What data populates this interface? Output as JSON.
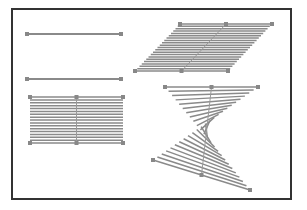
{
  "figure": {
    "frame": {
      "x": 12,
      "y": 9,
      "w": 279,
      "h": 190,
      "stroke": "#333333"
    },
    "line_color": "#8a8a8a",
    "handle_color": "#888888",
    "shapes": [
      {
        "name": "single-line-top",
        "type": "line",
        "x1": 27,
        "y1": 34,
        "x2": 121,
        "y2": 34
      },
      {
        "name": "single-line-middle",
        "type": "line",
        "x1": 27,
        "y1": 79,
        "x2": 121,
        "y2": 79
      },
      {
        "name": "rectangle-hatch",
        "type": "blend",
        "top": {
          "x1": 30,
          "y1": 97,
          "x2": 123,
          "y2": 97
        },
        "bottom": {
          "x1": 30,
          "y1": 143,
          "x2": 123,
          "y2": 143
        },
        "steps": 16
      },
      {
        "name": "parallelogram-hatch",
        "type": "blend",
        "top": {
          "x1": 180,
          "y1": 24,
          "x2": 272,
          "y2": 24
        },
        "bottom": {
          "x1": 135,
          "y1": 71,
          "x2": 228,
          "y2": 71
        },
        "steps": 20
      },
      {
        "name": "twisted-bowtie-hatch",
        "type": "blend",
        "top": {
          "x1": 165,
          "y1": 87,
          "x2": 258,
          "y2": 87
        },
        "bottom": {
          "x1": 250,
          "y1": 190,
          "x2": 153,
          "y2": 160
        },
        "steps": 24
      }
    ]
  }
}
